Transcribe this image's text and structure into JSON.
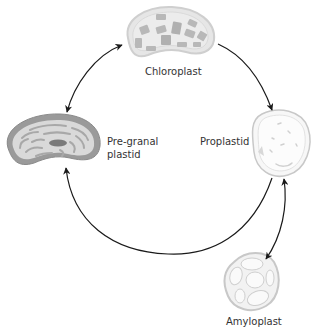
{
  "diagram": {
    "type": "plastid interconversion cycle",
    "nodes": [
      {
        "id": "chloroplast",
        "label": "Chloroplast"
      },
      {
        "id": "pre_granal",
        "label_line1": "Pre-granal",
        "label_line2": "plastid"
      },
      {
        "id": "proplastid",
        "label": "Proplastid"
      },
      {
        "id": "amyloplast",
        "label": "Amyloplast"
      }
    ],
    "edges": [
      {
        "from": "chloroplast",
        "to": "pre_granal",
        "direction": "both"
      },
      {
        "from": "chloroplast",
        "to": "proplastid",
        "direction": "forward"
      },
      {
        "from": "proplastid",
        "to": "pre_granal",
        "direction": "forward"
      },
      {
        "from": "proplastid",
        "to": "amyloplast",
        "direction": "both"
      }
    ],
    "colors": {
      "arrow": "#1a1a1a",
      "chloroplast_fill": "#e6e6e6",
      "chloroplast_grana": "#b8b8b8",
      "pregranal_outer": "#9a9a9a",
      "pregranal_fill": "#d9d9d9",
      "proplastid_fill": "#f7f7f7",
      "amyloplast_fill": "#f2f2f2"
    }
  }
}
